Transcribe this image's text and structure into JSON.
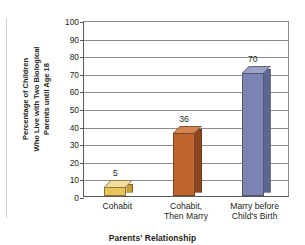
{
  "chart_data": {
    "type": "bar",
    "title": "",
    "subtitle": "",
    "categories": [
      "Cohabit",
      "Cohabit, Then Marry",
      "Marry before Child's Birth"
    ],
    "values": [
      5,
      36,
      70
    ],
    "value_labels": [
      "5",
      "36",
      "70"
    ],
    "series": [
      {
        "name": "Percentage of Children Who Live with Two Biological Parents until Age 18",
        "values": [
          5,
          36,
          70
        ]
      }
    ],
    "xlabel": "Parents' Relationship",
    "ylabel": "Percentage of Children Who Live with Two Biological Parents until Age 18",
    "ylabel_lines": [
      "Percentage of Children",
      "Who Live with Two Biological",
      "Parents until Age 18"
    ],
    "ylim": [
      0,
      100
    ],
    "ytick_step": 10,
    "yticks": [
      "0",
      "10",
      "20",
      "30",
      "40",
      "50",
      "60",
      "70",
      "80",
      "90",
      "100"
    ],
    "grid": true,
    "grid_axis": "y",
    "legend": false,
    "legend_position": "none",
    "bar_colors": [
      "#e8c55c",
      "#c1652f",
      "#7b84b5"
    ],
    "bar_top_colors": [
      "#f2dd9a",
      "#d4854f",
      "#9aa2c9"
    ],
    "bar_side_colors": [
      "#c69e33",
      "#8f431b",
      "#5c6693"
    ],
    "categories_lines": [
      [
        "Cohabit"
      ],
      [
        "Cohabit,",
        "Then Marry"
      ],
      [
        "Marry before",
        "Child's Birth"
      ]
    ]
  },
  "axis_color": "#58585a",
  "grid_color": "#8b8b8d",
  "text_color": "#231f20"
}
